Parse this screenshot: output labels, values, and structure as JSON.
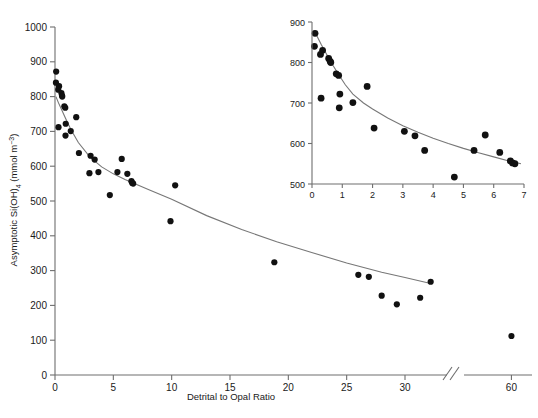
{
  "chart_data": {
    "type": "scatter",
    "title": "",
    "xlabel": "Detrital to Opal Ratio",
    "ylabel": "Asymptotic Si(OH)4 (mmol m-3)",
    "ylabel_parts": {
      "prefix": "Asymptotic Si(OH)",
      "sub": "4",
      "mid": " (mmol m",
      "sup": "−3",
      "suffix": ")"
    },
    "xlim": [
      0,
      62
    ],
    "ylim": [
      0,
      1000
    ],
    "grid": false,
    "legend": "none",
    "axis_break": {
      "present": true,
      "between": [
        33,
        55
      ],
      "symbol": "//"
    },
    "xticks": [
      0,
      5,
      10,
      15,
      20,
      25,
      30,
      60
    ],
    "xtick_labels": [
      "0",
      "5",
      "10",
      "15",
      "20",
      "25",
      "30",
      "60"
    ],
    "yticks": [
      0,
      100,
      200,
      300,
      400,
      500,
      600,
      700,
      800,
      900,
      1000
    ],
    "ytick_labels": [
      "0",
      "100",
      "200",
      "300",
      "400",
      "500",
      "600",
      "700",
      "800",
      "900",
      "1000"
    ],
    "points": [
      {
        "x": 0.1,
        "y": 872
      },
      {
        "x": 0.08,
        "y": 840
      },
      {
        "x": 0.35,
        "y": 830
      },
      {
        "x": 0.28,
        "y": 820
      },
      {
        "x": 0.55,
        "y": 810
      },
      {
        "x": 0.6,
        "y": 803
      },
      {
        "x": 0.62,
        "y": 800
      },
      {
        "x": 0.8,
        "y": 772
      },
      {
        "x": 0.88,
        "y": 768
      },
      {
        "x": 0.3,
        "y": 712
      },
      {
        "x": 0.92,
        "y": 722
      },
      {
        "x": 0.9,
        "y": 688
      },
      {
        "x": 1.35,
        "y": 701
      },
      {
        "x": 1.82,
        "y": 741
      },
      {
        "x": 2.05,
        "y": 638
      },
      {
        "x": 3.05,
        "y": 630
      },
      {
        "x": 3.4,
        "y": 619
      },
      {
        "x": 2.95,
        "y": 580
      },
      {
        "x": 3.72,
        "y": 583
      },
      {
        "x": 4.7,
        "y": 517
      },
      {
        "x": 5.35,
        "y": 583
      },
      {
        "x": 5.72,
        "y": 621
      },
      {
        "x": 6.2,
        "y": 578
      },
      {
        "x": 6.55,
        "y": 557
      },
      {
        "x": 6.62,
        "y": 552
      },
      {
        "x": 6.7,
        "y": 550
      },
      {
        "x": 10.3,
        "y": 545
      },
      {
        "x": 9.9,
        "y": 442
      },
      {
        "x": 18.8,
        "y": 324
      },
      {
        "x": 26.0,
        "y": 288
      },
      {
        "x": 26.9,
        "y": 282
      },
      {
        "x": 29.3,
        "y": 203
      },
      {
        "x": 28.0,
        "y": 228
      },
      {
        "x": 31.3,
        "y": 222
      },
      {
        "x": 32.2,
        "y": 268
      },
      {
        "x": 60.0,
        "y": 112
      }
    ],
    "fit_curve": {
      "description": "decaying power-law fit through scatter",
      "x_range": [
        0.08,
        32.2
      ],
      "points": [
        {
          "x": 0.08,
          "y": 800
        },
        {
          "x": 0.3,
          "y": 782
        },
        {
          "x": 0.6,
          "y": 760
        },
        {
          "x": 0.9,
          "y": 738
        },
        {
          "x": 1.35,
          "y": 706
        },
        {
          "x": 2.0,
          "y": 668
        },
        {
          "x": 3.0,
          "y": 626
        },
        {
          "x": 4.0,
          "y": 598
        },
        {
          "x": 5.0,
          "y": 578
        },
        {
          "x": 6.0,
          "y": 562
        },
        {
          "x": 6.7,
          "y": 552
        },
        {
          "x": 8.0,
          "y": 533
        },
        {
          "x": 10.0,
          "y": 505
        },
        {
          "x": 13.0,
          "y": 458
        },
        {
          "x": 16.0,
          "y": 418
        },
        {
          "x": 19.0,
          "y": 383
        },
        {
          "x": 22.0,
          "y": 352
        },
        {
          "x": 25.0,
          "y": 322
        },
        {
          "x": 28.0,
          "y": 295
        },
        {
          "x": 30.0,
          "y": 280
        },
        {
          "x": 32.2,
          "y": 263
        }
      ]
    },
    "inset": {
      "type": "scatter",
      "xlim": [
        0,
        7
      ],
      "ylim": [
        500,
        900
      ],
      "xticks": [
        0,
        1,
        2,
        3,
        4,
        5,
        6,
        7
      ],
      "xtick_labels": [
        "0",
        "1",
        "2",
        "3",
        "4",
        "5",
        "6",
        "7"
      ],
      "yticks": [
        500,
        600,
        700,
        800,
        900
      ],
      "ytick_labels": [
        "500",
        "600",
        "700",
        "800",
        "900"
      ],
      "xlabel": "",
      "ylabel": "",
      "grid": false,
      "points": [
        {
          "x": 0.1,
          "y": 872
        },
        {
          "x": 0.08,
          "y": 840
        },
        {
          "x": 0.35,
          "y": 830
        },
        {
          "x": 0.28,
          "y": 820
        },
        {
          "x": 0.55,
          "y": 810
        },
        {
          "x": 0.6,
          "y": 803
        },
        {
          "x": 0.62,
          "y": 800
        },
        {
          "x": 0.8,
          "y": 772
        },
        {
          "x": 0.88,
          "y": 768
        },
        {
          "x": 0.3,
          "y": 712
        },
        {
          "x": 0.92,
          "y": 722
        },
        {
          "x": 0.9,
          "y": 688
        },
        {
          "x": 1.35,
          "y": 701
        },
        {
          "x": 1.82,
          "y": 741
        },
        {
          "x": 2.05,
          "y": 638
        },
        {
          "x": 3.05,
          "y": 630
        },
        {
          "x": 3.4,
          "y": 619
        },
        {
          "x": 3.72,
          "y": 583
        },
        {
          "x": 4.7,
          "y": 517
        },
        {
          "x": 5.35,
          "y": 583
        },
        {
          "x": 5.72,
          "y": 621
        },
        {
          "x": 6.2,
          "y": 578
        },
        {
          "x": 6.55,
          "y": 557
        },
        {
          "x": 6.62,
          "y": 552
        },
        {
          "x": 6.7,
          "y": 550
        }
      ],
      "fit_curve": {
        "points": [
          {
            "x": 0.08,
            "y": 878
          },
          {
            "x": 0.3,
            "y": 845
          },
          {
            "x": 0.5,
            "y": 818
          },
          {
            "x": 0.7,
            "y": 792
          },
          {
            "x": 0.9,
            "y": 768
          },
          {
            "x": 1.1,
            "y": 745
          },
          {
            "x": 1.35,
            "y": 722
          },
          {
            "x": 1.7,
            "y": 700
          },
          {
            "x": 2.0,
            "y": 685
          },
          {
            "x": 2.5,
            "y": 663
          },
          {
            "x": 3.0,
            "y": 644
          },
          {
            "x": 3.5,
            "y": 628
          },
          {
            "x": 4.0,
            "y": 613
          },
          {
            "x": 4.5,
            "y": 600
          },
          {
            "x": 5.0,
            "y": 588
          },
          {
            "x": 5.5,
            "y": 577
          },
          {
            "x": 6.0,
            "y": 567
          },
          {
            "x": 6.5,
            "y": 557
          },
          {
            "x": 6.9,
            "y": 550
          }
        ]
      }
    }
  }
}
